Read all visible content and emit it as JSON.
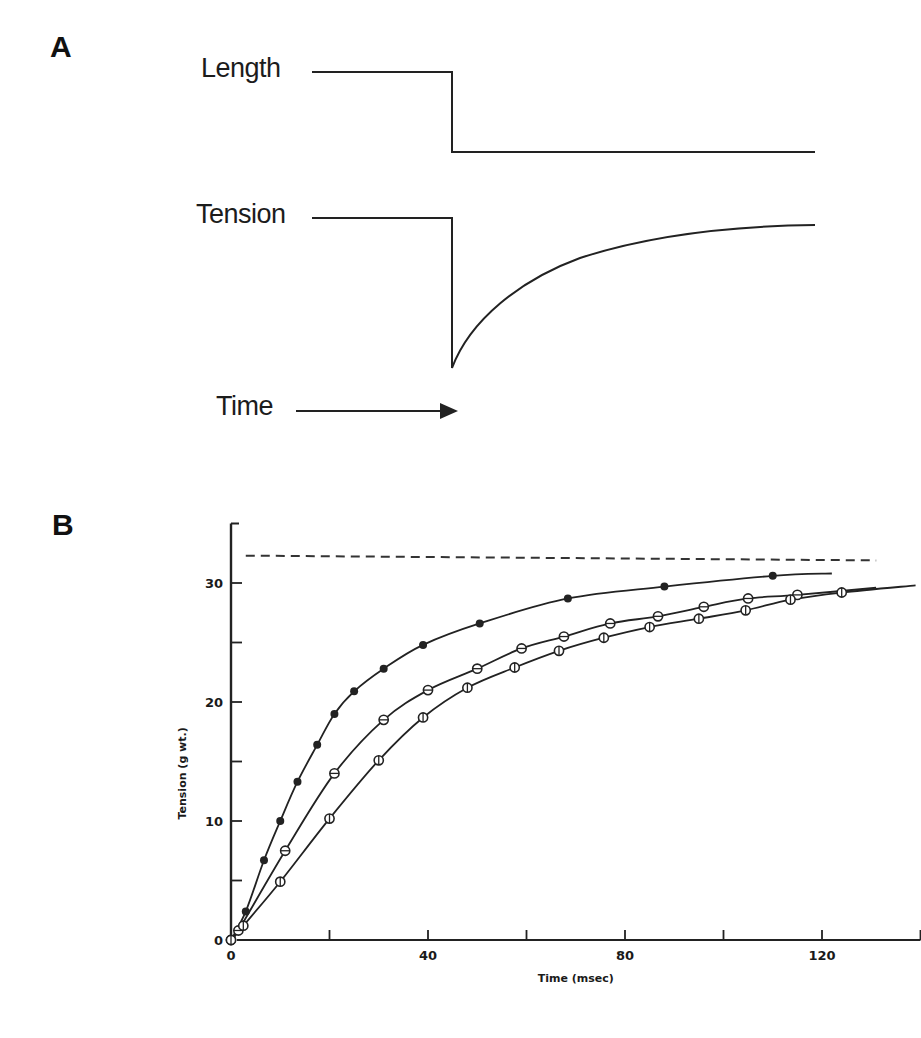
{
  "figure": {
    "panel_a": {
      "label": "A",
      "traces": {
        "length_label": "Length",
        "tension_label": "Tension",
        "time_label": "Time"
      },
      "description": "Step decrease in length causes abrupt tension drop followed by exponential recovery"
    },
    "panel_b": {
      "label": "B"
    }
  },
  "chart_data": [
    {
      "panel": "A",
      "type": "line",
      "title": "",
      "series": [
        {
          "name": "Length",
          "shape": "step-down",
          "before": "high",
          "after": "low"
        },
        {
          "name": "Tension",
          "shape": "drop-then-recover",
          "before": "high",
          "min": "low",
          "after": "near-original"
        }
      ],
      "xlabel": "Time",
      "ylabel": "",
      "arrow": "Time →"
    },
    {
      "panel": "B",
      "type": "scatter",
      "title": "",
      "xlabel": "Time (msec)",
      "ylabel": "Tension (g wt.)",
      "xlim": [
        0,
        140
      ],
      "ylim": [
        0,
        35
      ],
      "x_ticks": [
        0,
        40,
        80,
        120
      ],
      "x_minor_ticks": [
        20,
        60,
        100,
        140
      ],
      "y_ticks": [
        0,
        10,
        20,
        30
      ],
      "y_minor_ticks": [
        5,
        15,
        25
      ],
      "grid": false,
      "legend": "none",
      "reference_line": {
        "style": "dashed",
        "y_start": 32.3,
        "y_end": 31.9,
        "x_start": 3,
        "x_end": 131
      },
      "series": [
        {
          "name": "filled circles",
          "marker": "filled-circle",
          "x": [
            0,
            3,
            6.7,
            10,
            13.5,
            17.5,
            21,
            25,
            31,
            39,
            50.5,
            68.4,
            88,
            110
          ],
          "y": [
            0,
            2.4,
            6.7,
            10.0,
            13.3,
            16.4,
            19.0,
            20.9,
            22.8,
            24.8,
            26.6,
            28.7,
            29.7,
            30.6
          ],
          "curve_end": [
            122,
            30.8
          ]
        },
        {
          "name": "horizontal-bar circles",
          "marker": "circle-hbar",
          "x": [
            0,
            1.5,
            11,
            21,
            31,
            40,
            50,
            59,
            67.6,
            77,
            86.7,
            96,
            105,
            115
          ],
          "y": [
            0,
            0.8,
            7.5,
            14.0,
            18.5,
            21.0,
            22.8,
            24.5,
            25.5,
            26.6,
            27.2,
            28.0,
            28.7,
            29.0
          ],
          "curve_end": [
            131,
            29.6
          ]
        },
        {
          "name": "vertical-bar circles",
          "marker": "circle-vbar",
          "x": [
            0,
            2.5,
            10,
            20,
            30,
            39,
            48,
            57.6,
            66.6,
            75.7,
            85,
            95,
            104.5,
            113.6,
            124
          ],
          "y": [
            0,
            1.2,
            4.9,
            10.2,
            15.1,
            18.7,
            21.2,
            22.9,
            24.3,
            25.4,
            26.3,
            27.0,
            27.7,
            28.6,
            29.2
          ],
          "curve_end": [
            139,
            29.8
          ]
        }
      ]
    }
  ]
}
